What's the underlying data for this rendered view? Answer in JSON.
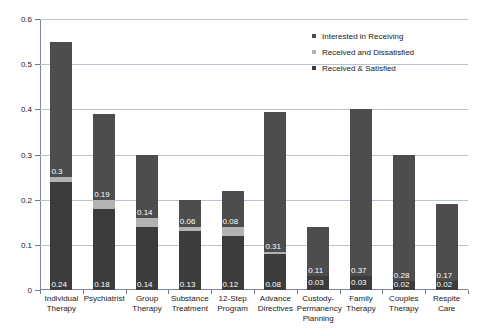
{
  "chart_data": {
    "type": "bar",
    "subtype": "stacked",
    "title": "",
    "xlabel": "",
    "ylabel": "",
    "ylim": [
      0,
      0.6
    ],
    "yticks": [
      0,
      0.1,
      0.2,
      0.3,
      0.4,
      0.5,
      0.6
    ],
    "ytick_labels": [
      "0",
      "0.1",
      "0.2",
      "0.3",
      "0.4",
      "0.5",
      "0.6"
    ],
    "grid": true,
    "legend_position": "top-right",
    "categories": [
      "Individual Therapy",
      "Psychiatrist",
      "Group Therapy",
      "Substance Treatment",
      "12-Step Program",
      "Advance Directives",
      "Custody-Permanency Planning",
      "Family Therapy",
      "Couples Therapy",
      "Respite Care"
    ],
    "series": [
      {
        "name": "Received & Satisfied",
        "color": "#3c3c3c",
        "values": [
          0.24,
          0.18,
          0.14,
          0.13,
          0.12,
          0.08,
          0.03,
          0.03,
          0.02,
          0.02
        ],
        "labels": [
          "0.24",
          "0.18",
          "0.14",
          "0.13",
          "0.12",
          "0.08",
          "0.03",
          "0.03",
          "0.02",
          "0.02"
        ]
      },
      {
        "name": "Received and Dissatisfied",
        "color": "#b3b3b3",
        "values": [
          0.01,
          0.02,
          0.02,
          0.01,
          0.02,
          0.005,
          0,
          0,
          0,
          0
        ],
        "labels": [
          "",
          "",
          "",
          "",
          "",
          "",
          "",
          "",
          "",
          ""
        ]
      },
      {
        "name": "Interested in Receiving",
        "color": "#4d4d4d",
        "values": [
          0.3,
          0.19,
          0.14,
          0.06,
          0.08,
          0.31,
          0.11,
          0.37,
          0.28,
          0.17
        ],
        "labels": [
          "0.3",
          "0.19",
          "0.14",
          "0.06",
          "0.08",
          "0.31",
          "0.11",
          "0.37",
          "0.28",
          "0.17"
        ]
      }
    ],
    "totals": [
      0.55,
      0.39,
      0.3,
      0.2,
      0.22,
      0.395,
      0.14,
      0.4,
      0.3,
      0.19
    ]
  },
  "legend": {
    "items": [
      {
        "label": "Interested in Receiving",
        "color": "#4d4d4d"
      },
      {
        "label": "Received and Dissatisfied",
        "color": "#b3b3b3"
      },
      {
        "label": "Received & Satisfied",
        "color": "#3c3c3c"
      }
    ]
  }
}
